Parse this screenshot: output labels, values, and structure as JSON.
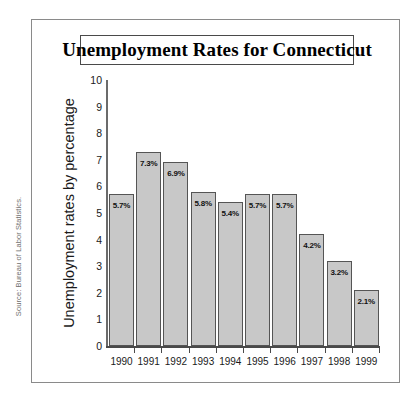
{
  "figure": {
    "source_note": "Source: Bureau of Labor Statistics."
  },
  "chart_data": {
    "type": "bar",
    "title": "Unemployment Rates for Connecticut",
    "xlabel": "",
    "ylabel": "Unemployment rates by percentage",
    "ylim": [
      0,
      10
    ],
    "ytick_labels": [
      "10",
      "9",
      "8",
      "7",
      "6",
      "5",
      "4",
      "3",
      "2",
      "1",
      "0"
    ],
    "yticks": [
      10,
      9,
      8,
      7,
      6,
      5,
      4,
      3,
      2,
      1,
      0
    ],
    "grid": false,
    "legend": null,
    "bar_color": "#c8c8c8",
    "bar_edge_color": "#555555",
    "categories": [
      "1990",
      "1991",
      "1992",
      "1993",
      "1994",
      "1995",
      "1996",
      "1997",
      "1998",
      "1999"
    ],
    "values": [
      5.7,
      7.3,
      6.9,
      5.8,
      5.4,
      5.7,
      5.7,
      4.2,
      3.2,
      2.1
    ],
    "data_labels": [
      "5.7%",
      "7.3%",
      "6.9%",
      "5.8%",
      "5.4%",
      "5.7%",
      "5.7%",
      "4.2%",
      "3.2%",
      "2.1%"
    ]
  }
}
